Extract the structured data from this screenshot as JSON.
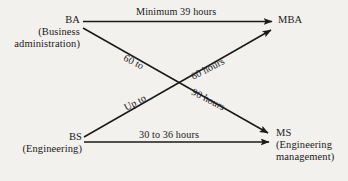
{
  "diagram": {
    "type": "flow-diagram",
    "background_color": "#f2f1ee",
    "line_color": "#1a1a1a",
    "nodes": [
      {
        "id": "ba",
        "position": "top-left",
        "lines": [
          "BA",
          "(Business",
          "administration)"
        ],
        "line1": "BA",
        "line2": "(Business",
        "line3": "administration)"
      },
      {
        "id": "bs",
        "position": "bottom-left",
        "lines": [
          "BS",
          "(Engineering)"
        ],
        "line1": "BS",
        "line2": "(Engineering)"
      },
      {
        "id": "mba",
        "position": "top-right",
        "lines": [
          "MBA"
        ],
        "line1": "MBA"
      },
      {
        "id": "ms",
        "position": "bottom-right",
        "lines": [
          "MS",
          "(Engineering",
          "management)"
        ],
        "line1": "MS",
        "line2": "(Engineering",
        "line3": "management)"
      }
    ],
    "edges": [
      {
        "id": "ba-to-mba",
        "from": "ba",
        "to": "mba",
        "label": "Minimum 39 hours",
        "orientation": "horizontal"
      },
      {
        "id": "ba-to-ms",
        "from": "ba",
        "to": "ms",
        "label": "60 to 90 hours",
        "label_part1": "60 to",
        "label_part2": "90 hours",
        "orientation": "diagonal-down"
      },
      {
        "id": "bs-to-mba",
        "from": "bs",
        "to": "mba",
        "label": "Up to 60 hours",
        "label_part1": "Up to",
        "label_part2": "60 hours",
        "orientation": "diagonal-up"
      },
      {
        "id": "bs-to-ms",
        "from": "bs",
        "to": "ms",
        "label": "30 to 36 hours",
        "orientation": "horizontal"
      }
    ]
  }
}
